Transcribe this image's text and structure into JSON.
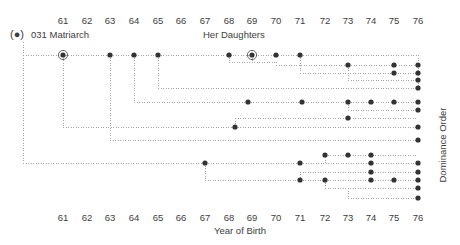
{
  "figure": {
    "title_left": "031  Matriarch",
    "title_center": "Her Daughters",
    "axis_bottom_title": "Year of Birth",
    "axis_right_title": "Dominance Order",
    "matriarch_symbol": "(●)"
  },
  "axis": {
    "top_ticks": [
      "61",
      "62",
      "63",
      "64",
      "65",
      "66",
      "67",
      "68",
      "69",
      "70",
      "71",
      "72",
      "73",
      "74",
      "75",
      "76"
    ],
    "bottom_ticks": [
      "61",
      "62",
      "63",
      "64",
      "65",
      "66",
      "67",
      "68",
      "69",
      "70",
      "71",
      "72",
      "73",
      "74",
      "75",
      "76"
    ]
  },
  "colors": {
    "dot": "#333333",
    "line": "#9a9a9a",
    "text": "#3d3d3d",
    "background": "#ffffff"
  },
  "chart_data": {
    "type": "scatter",
    "xlabel": "Year of Birth",
    "ylabel": "Dominance Order",
    "xlim": [
      60.4,
      76.6
    ],
    "ylim": [
      0,
      17
    ],
    "grid": false,
    "legend": null,
    "x_tick_values": [
      61,
      62,
      63,
      64,
      65,
      66,
      67,
      68,
      69,
      70,
      71,
      72,
      73,
      74,
      75,
      76
    ],
    "x_tick_labels": [
      "61",
      "62",
      "63",
      "64",
      "65",
      "66",
      "67",
      "68",
      "69",
      "70",
      "71",
      "72",
      "73",
      "74",
      "75",
      "76"
    ],
    "x_pixels": {
      "61": 63,
      "62": 87,
      "63": 110,
      "64": 134,
      "65": 158,
      "66": 181,
      "67": 205,
      "68": 229,
      "69": 252,
      "70": 276,
      "71": 300,
      "72": 325,
      "73": 348,
      "74": 371,
      "75": 394,
      "76": 418
    },
    "rows": [
      {
        "row": 1,
        "y_px": 55,
        "births": [
          61,
          63,
          64,
          65,
          68,
          69,
          70,
          71
        ],
        "circled": [
          61,
          69
        ]
      },
      {
        "row": 2,
        "y_px": 65,
        "births": [
          73,
          75,
          76
        ],
        "circled": []
      },
      {
        "row": 3,
        "y_px": 73,
        "births": [
          75,
          76
        ],
        "circled": []
      },
      {
        "row": 4,
        "y_px": 80,
        "births": [
          76
        ],
        "circled": []
      },
      {
        "row": 5,
        "y_px": 88,
        "births": [
          76
        ],
        "circled": []
      },
      {
        "row": 6,
        "y_px": 102,
        "births": [
          69,
          72,
          73,
          74,
          75,
          76
        ],
        "circled": []
      },
      {
        "row": 7,
        "y_px": 110,
        "births": [
          76
        ],
        "circled": []
      },
      {
        "row": 8,
        "y_px": 118,
        "births": [
          73
        ],
        "circled": []
      },
      {
        "row": 9,
        "y_px": 127,
        "births": [
          68,
          76
        ],
        "circled": []
      },
      {
        "row": 10,
        "y_px": 140,
        "births": [
          76
        ],
        "circled": []
      },
      {
        "row": 11,
        "y_px": 155,
        "births": [
          72,
          73,
          74
        ],
        "circled": []
      },
      {
        "row": 12,
        "y_px": 163,
        "births": [
          67,
          71,
          74,
          76
        ],
        "circled": []
      },
      {
        "row": 13,
        "y_px": 172,
        "births": [
          74,
          76
        ],
        "circled": []
      },
      {
        "row": 14,
        "y_px": 180,
        "births": [
          71,
          72,
          74,
          75,
          76
        ],
        "circled": []
      },
      {
        "row": 15,
        "y_px": 188,
        "births": [
          76
        ],
        "circled": []
      },
      {
        "row": 16,
        "y_px": 198,
        "births": [
          76
        ],
        "circled": []
      }
    ],
    "matriarch": {
      "label": "031",
      "symbol": "(●)",
      "x_px": 22,
      "y_px": 34
    },
    "total_offspring": 49
  }
}
